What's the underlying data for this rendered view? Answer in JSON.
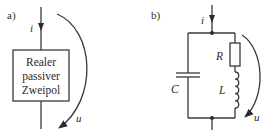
{
  "panel_a": {
    "label": "a)",
    "current_label": "i",
    "voltage_label": "u",
    "box_lines": [
      "Realer",
      "passiver",
      "Zweipol"
    ]
  },
  "panel_b": {
    "label": "b)",
    "current_label": "i",
    "voltage_label": "u",
    "capacitor_label": "C",
    "resistor_label": "R",
    "inductor_label": "L"
  },
  "colors": {
    "stroke": "#3a3a3a",
    "background": "#ffffff"
  }
}
